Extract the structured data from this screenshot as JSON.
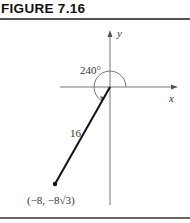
{
  "figure": {
    "label": "FIGURE 7.16",
    "axes": {
      "x_label": "x",
      "y_label": "y"
    },
    "angle_label": "240°",
    "length_label": "16",
    "point_label": "(−8, −8√3)"
  }
}
